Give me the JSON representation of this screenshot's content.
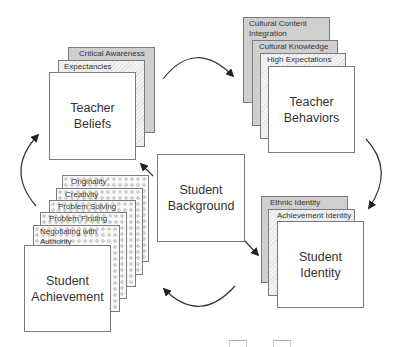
{
  "diagram": {
    "teacher_beliefs": {
      "title": "Teacher\nBeliefs",
      "layers": [
        "Critical Awareness",
        "Expectancies"
      ]
    },
    "teacher_behaviors": {
      "title": "Teacher\nBehaviors",
      "layers": [
        "Cultural Content\nIntegration",
        "Cultural Knowledge",
        "High Expectations"
      ]
    },
    "student_identity": {
      "title": "Student\nIdentity",
      "layers": [
        "Ethnic Identity",
        "Achievement Identity"
      ]
    },
    "student_achievement": {
      "title": "Student\nAchievement",
      "layers": [
        "Originality",
        "Creativity",
        "Problem Solving",
        "Problem Finding",
        "Negotiating with\nAuthority"
      ]
    },
    "student_background": {
      "title": "Student\nBackground"
    },
    "colors": {
      "layer_gray": "#cfcfcf",
      "border": "#7a7a7a",
      "arrow": "#222222"
    }
  }
}
